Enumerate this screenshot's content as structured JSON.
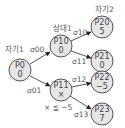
{
  "diagram": {
    "type": "game-tree",
    "colors": {
      "node_fill": "#e6e6e6",
      "node_stroke": "#555555",
      "text": "#444444",
      "arrow": "#222222"
    },
    "nodes": {
      "p0": {
        "name": "P0",
        "value": "0"
      },
      "p10": {
        "name": "P10",
        "value": "0"
      },
      "p11": {
        "name": "P11",
        "value": "×"
      },
      "p20": {
        "name": "P20",
        "value": "5"
      },
      "p21": {
        "name": "P21",
        "value": "0"
      },
      "p22": {
        "name": "P22",
        "value": "−5"
      },
      "p23": {
        "name": "P23",
        "value": "7"
      }
    },
    "edges": {
      "e00": {
        "label": "σ00",
        "from": "P0",
        "to": "P10"
      },
      "e01": {
        "label": "σ01",
        "from": "P0",
        "to": "P11"
      },
      "e10": {
        "label": "σ10",
        "from": "P10",
        "to": "P20"
      },
      "e11": {
        "label": "σ11",
        "from": "P10",
        "to": "P21"
      },
      "e12": {
        "label": "σ12",
        "from": "P11",
        "to": "P22"
      },
      "e13": {
        "label": "σ13",
        "from": "P11",
        "to": "P23"
      }
    },
    "annotations": {
      "self1": "자기1",
      "opp1": "상대1",
      "self2": "자기2",
      "condition": "× ≦ −5"
    }
  }
}
